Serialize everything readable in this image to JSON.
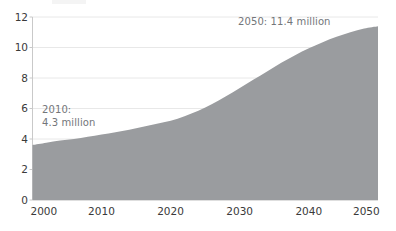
{
  "chart_data": {
    "type": "area",
    "title": "",
    "subtitle": "",
    "xlabel": "",
    "ylabel": "",
    "xlim": [
      2000,
      2050
    ],
    "ylim": [
      0,
      12
    ],
    "grid": "horizontal",
    "legend": "none",
    "series": [
      {
        "name": "Population (millions)",
        "color": "#9a9c9f",
        "x": [
          2000,
          2002,
          2004,
          2006,
          2008,
          2010,
          2012,
          2014,
          2016,
          2018,
          2020,
          2022,
          2024,
          2026,
          2028,
          2030,
          2032,
          2034,
          2036,
          2038,
          2040,
          2042,
          2044,
          2046,
          2048,
          2050
        ],
        "values": [
          3.6,
          3.75,
          3.9,
          4.0,
          4.15,
          4.3,
          4.45,
          4.6,
          4.8,
          5.0,
          5.2,
          5.5,
          5.85,
          6.3,
          6.8,
          7.35,
          7.9,
          8.45,
          9.0,
          9.5,
          9.95,
          10.35,
          10.7,
          11.0,
          11.25,
          11.4
        ]
      }
    ],
    "x_ticks": [
      "2000",
      "2010",
      "2020",
      "2030",
      "2040",
      "2050"
    ],
    "x_tick_values": [
      2000,
      2010,
      2020,
      2030,
      2040,
      2050
    ],
    "y_ticks": [
      "0",
      "2",
      "4",
      "6",
      "8",
      "10",
      "12"
    ],
    "y_tick_values": [
      0,
      2,
      4,
      6,
      8,
      10,
      12
    ],
    "annotations": [
      {
        "id": "a2050",
        "text": "2050: 11.4 million",
        "x": 2050,
        "y": 11.4
      },
      {
        "id": "a2010",
        "text": "2010:\n4.3 million",
        "x": 2010,
        "y": 4.3
      }
    ]
  },
  "colors": {
    "area_fill": "#9a9c9f",
    "gridline": "#e8e8e8",
    "axis": "#c9c9c9",
    "tick_text": "#3a3a3a",
    "annotation_text": "#73767a",
    "background": "#ffffff"
  },
  "axis_labels": {
    "y": [
      "12",
      "10",
      "8",
      "6",
      "4",
      "2",
      "0"
    ],
    "x": [
      "2000",
      "2010",
      "2020",
      "2030",
      "2040",
      "2050"
    ]
  },
  "annotations_text": {
    "peak": "2050: 11.4 million",
    "baseline_line1": "2010:",
    "baseline_line2": "4.3 million"
  }
}
